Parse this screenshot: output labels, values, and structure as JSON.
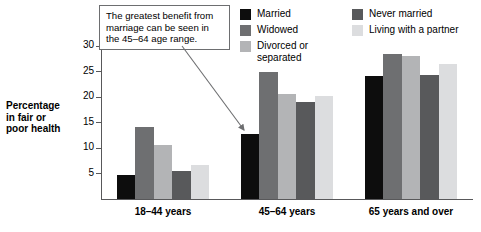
{
  "chart_data": {
    "type": "bar",
    "title": "",
    "xlabel": "",
    "ylabel": "Percentage in fair or poor health",
    "categories": [
      "18–44 years",
      "45–64 years",
      "65 years and over"
    ],
    "series": [
      {
        "name": "Married",
        "color": "#0d0d0d",
        "values": [
          4.7,
          12.8,
          24.2
        ]
      },
      {
        "name": "Widowed",
        "color": "#6e6f71",
        "values": [
          14.2,
          25.0,
          28.4
        ]
      },
      {
        "name": "Divorced or separated",
        "color": "#b3b4b6",
        "values": [
          10.5,
          20.6,
          28.0
        ]
      },
      {
        "name": "Never married",
        "color": "#58595b",
        "values": [
          5.4,
          19.0,
          24.3
        ]
      },
      {
        "name": "Living with a partner",
        "color": "#dcdddf",
        "values": [
          6.6,
          20.2,
          26.4
        ]
      }
    ],
    "ylim": [
      0,
      30
    ],
    "yticks": [
      5,
      10,
      15,
      20,
      25,
      30
    ],
    "ytick_labels": [
      "5",
      "10",
      "15",
      "20",
      "25",
      "30"
    ],
    "grid": false,
    "legend_position": "top-right",
    "annotations": [
      {
        "text": "The greatest benefit from marriage can be seen in the 45–64 age range.",
        "points_to": "Married bar in 45–64 years group"
      }
    ]
  },
  "axis": {
    "y_title_lines": [
      "Percentage",
      "in fair or",
      "poor health"
    ]
  },
  "legend": {
    "left_column": [
      {
        "label": "Married",
        "color": "#0d0d0d"
      },
      {
        "label": "Widowed",
        "color": "#6e6f71"
      },
      {
        "label": "Divorced or\nseparated",
        "color": "#b3b4b6"
      }
    ],
    "right_column": [
      {
        "label": "Never married",
        "color": "#58595b"
      },
      {
        "label": "Living with a partner",
        "color": "#dcdddf"
      }
    ]
  },
  "callout": {
    "text": "The greatest benefit from marriage can be seen in the 45–64 age range."
  }
}
